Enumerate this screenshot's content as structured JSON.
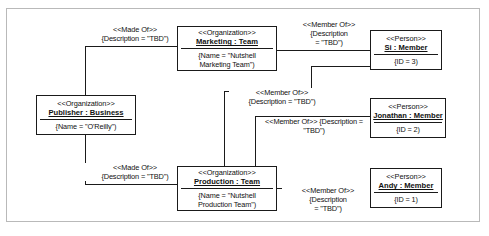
{
  "diagram": {
    "type": "uml-object-diagram",
    "objects": [
      {
        "id": "marketing-team",
        "stereotype": "<<Organization>>",
        "name": "Marketing : Team",
        "attributes": [
          "{Name = \"Nutshell",
          "Marketing Team\")"
        ]
      },
      {
        "id": "publisher",
        "stereotype": "<<Organization>>",
        "name": "Publisher : Business",
        "attributes": [
          "{Name = \"O'Reilly\")"
        ]
      },
      {
        "id": "production-team",
        "stereotype": "<<Organization>>",
        "name": "Production : Team",
        "attributes": [
          "{Name = \"Nutshell",
          "Production Team\")"
        ]
      },
      {
        "id": "si-member",
        "stereotype": "<<Person>>",
        "name": "Si : Member",
        "attributes": [
          "{ID = 3)"
        ]
      },
      {
        "id": "jonathan-member",
        "stereotype": "<<Person>>",
        "name": "Jonathan : Member",
        "attributes": [
          "{ID = 2)"
        ]
      },
      {
        "id": "andy-member",
        "stereotype": "<<Person>>",
        "name": "Andy : Member",
        "attributes": [
          "{ID = 1)"
        ]
      }
    ],
    "links": [
      {
        "id": "publisher-marketing",
        "stereotype": "<<Made Of>>",
        "line2": "{Description = \"TBD\")",
        "line3": ""
      },
      {
        "id": "marketing-si",
        "stereotype": "<<Member Of>>",
        "line2": "{Description",
        "line3": "= \"TBD\")"
      },
      {
        "id": "production-si",
        "stereotype": "<<Member Of>>",
        "line2": "{Description = \"TBD\")",
        "line3": ""
      },
      {
        "id": "production-jonathan",
        "stereotype": "<<Member Of>> {Description =",
        "line2": "\"TBD\")",
        "line3": ""
      },
      {
        "id": "publisher-production",
        "stereotype": "<<Made Of>>",
        "line2": "{Description = \"TBD\")",
        "line3": ""
      },
      {
        "id": "production-andy",
        "stereotype": "<<Member Of>>",
        "line2": "{Description",
        "line3": "= \"TBD\")"
      }
    ]
  },
  "colors": {
    "box_border": "#1a1a1a",
    "connector": "#1a1a1a",
    "frame_border": "#b9b9b9",
    "background": "#ffffff",
    "text": "#111111"
  }
}
